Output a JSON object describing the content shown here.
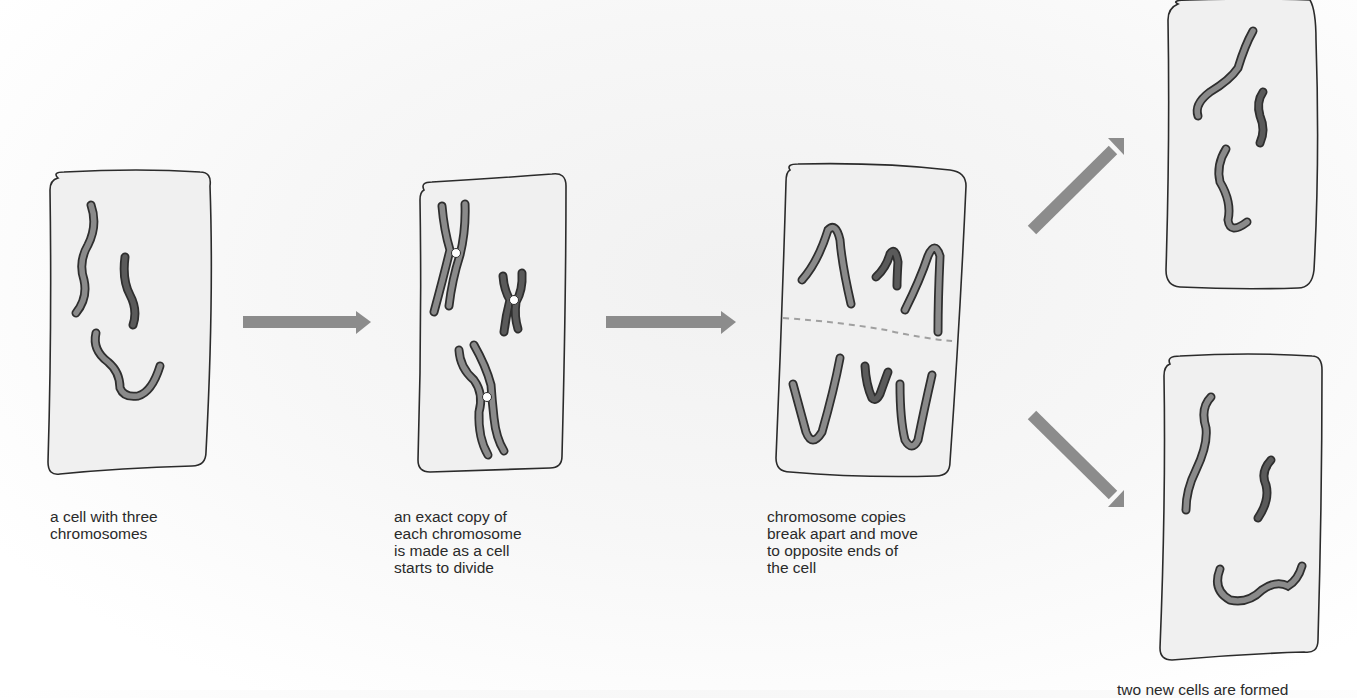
{
  "colors": {
    "cell_fill": "#f0f0f0",
    "cell_outline": "#2b2b2b",
    "chromosome_light": "#8a8a8a",
    "chromosome_dark": "#5a5a5a",
    "chromosome_outline": "#2e2e2e",
    "centromere": "#ffffff",
    "arrow": "#8c8c8c",
    "split_line": "#a0a0a0",
    "text": "#2a2a2a"
  },
  "stages": [
    {
      "id": "stage-1",
      "caption": "a cell with three\nchromosomes",
      "chromosomes": 3
    },
    {
      "id": "stage-2",
      "caption": "an exact copy of\neach chromosome\nis made as a cell\nstarts to divide",
      "chromosome_pairs": 3
    },
    {
      "id": "stage-3",
      "caption": "chromosome copies\nbreak apart and move\nto opposite ends of\nthe cell",
      "chromosomes": 6
    },
    {
      "id": "stage-4",
      "caption": "two new cells are formed",
      "daughter_cells": 2,
      "chromosomes_per_cell": 3
    }
  ],
  "arrows": [
    {
      "from": "stage-1",
      "to": "stage-2",
      "direction": "right"
    },
    {
      "from": "stage-2",
      "to": "stage-3",
      "direction": "right"
    },
    {
      "from": "stage-3",
      "to": "stage-4-top",
      "direction": "up-right"
    },
    {
      "from": "stage-3",
      "to": "stage-4-bottom",
      "direction": "down-right"
    }
  ]
}
